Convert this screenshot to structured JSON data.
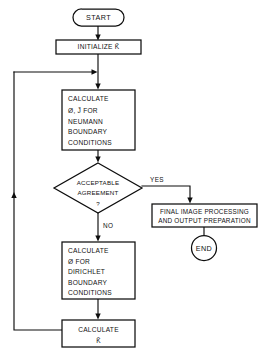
{
  "diagram": {
    "colors": {
      "stroke": "#0d0d0d",
      "fill": "#ffffff",
      "text": "#111111",
      "background": "#ffffff"
    },
    "nodes": {
      "start": {
        "shape": "terminal-oval",
        "label": "START"
      },
      "initialize": {
        "shape": "process-box",
        "label": "INITIALIZE  K̃"
      },
      "calc_neumann": {
        "shape": "process-box",
        "lines": [
          "CALCULATE",
          "Ø, J̃  FOR",
          "NEUMANN",
          "BOUNDARY",
          "CONDITIONS"
        ]
      },
      "decision": {
        "shape": "decision-diamond",
        "lines": [
          "ACCEPTABLE",
          "AGREEMENT",
          "?"
        ]
      },
      "final_processing": {
        "shape": "process-box",
        "lines": [
          "FINAL IMAGE PROCESSING",
          "AND  OUTPUT PREPARATION"
        ]
      },
      "end": {
        "shape": "terminal-circle",
        "label": "END"
      },
      "calc_dirichlet": {
        "shape": "process-box",
        "lines": [
          "CALCULATE",
          "Ø   FOR",
          "DIRICHLET",
          "BOUNDARY",
          "CONDITIONS"
        ]
      },
      "calc_k": {
        "shape": "process-box",
        "lines": [
          "CALCULATE",
          "K̃"
        ]
      }
    },
    "edge_labels": {
      "yes": "YES",
      "no": "NO"
    }
  }
}
